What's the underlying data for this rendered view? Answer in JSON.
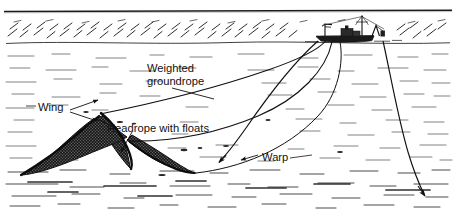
{
  "figure": {
    "type": "line-art-diagram",
    "background_color": "#ffffff",
    "ink_color": "#111111",
    "width": 456,
    "height": 221
  },
  "labels": {
    "weighted_groundrope_line1": "Weighted",
    "weighted_groundrope_line2": "groundrope",
    "wing": "Wing",
    "headrope_with_floats": "Headrope with floats",
    "warp": "Warp"
  },
  "parts": {
    "vessel": "fishing-trawler",
    "sea_surface": "horizon-waterline",
    "water_texture": "stippled-horizontal-hatching",
    "net": "trawl-net-wings-and-mouth",
    "warps": "towing-warp-cables",
    "groundrope": "weighted-groundrope-curve",
    "headrope": "headrope-with-floats-curve"
  },
  "annotations": {
    "weighted_groundrope_leader": "diagonal leader line from text down-right to groundrope curve",
    "wing_leaders": "two arrows from 'Wing' text pointing right to net wings",
    "headrope_leader": "arrow from 'Headrope with floats' text down-left to headrope",
    "warp_leader": "short leader from 'Warp' text up-left to warp cable"
  },
  "colors": {
    "ink": "#111111",
    "paper": "#ffffff",
    "net_fill": "#2b2b2b",
    "texture": "#555555"
  }
}
